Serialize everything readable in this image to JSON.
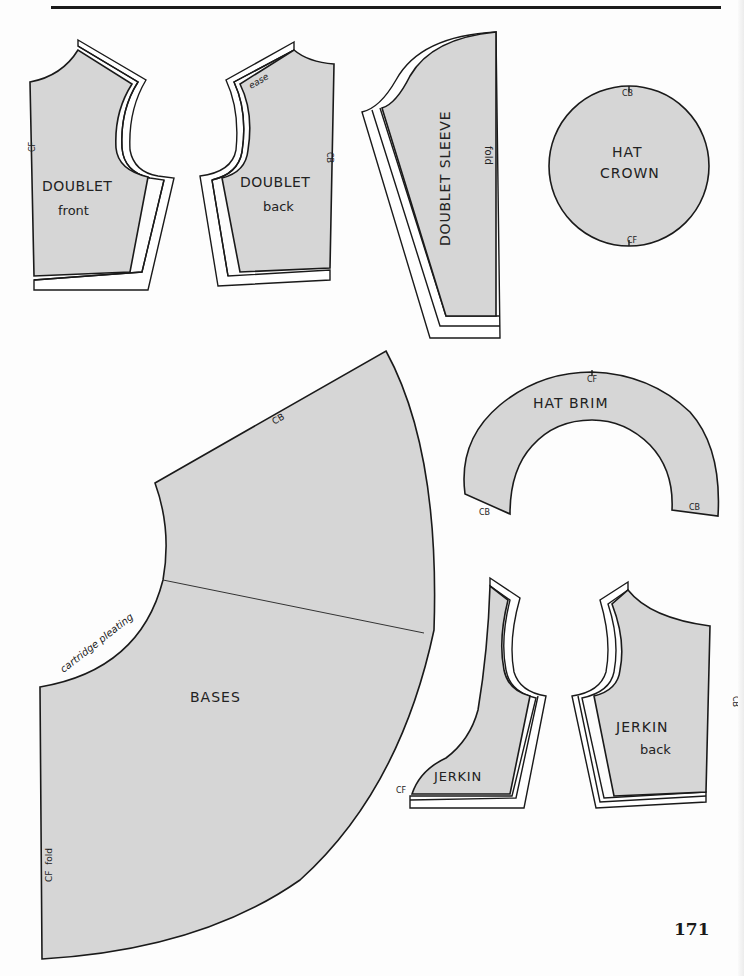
{
  "page": {
    "number": "171",
    "colors": {
      "fill": "#d6d6d6",
      "stroke": "#1a1a1a",
      "paper": "#fdfdfd"
    }
  },
  "pieces": {
    "doublet_front": {
      "title": "DOUBLET",
      "subtitle": "front",
      "mark_cf": "CF"
    },
    "doublet_back": {
      "title": "DOUBLET",
      "subtitle": "back",
      "mark_cb": "CB",
      "note_ease": "ease"
    },
    "doublet_sleeve": {
      "title": "DOUBLET SLEEVE",
      "mark_fold": "fold"
    },
    "hat_crown": {
      "title_line1": "HAT",
      "title_line2": "CROWN",
      "mark_cb": "CB",
      "mark_cf": "CF"
    },
    "hat_brim": {
      "title": "HAT BRIM",
      "mark_cf": "CF",
      "mark_cb_left": "CB",
      "mark_cb_right": "CB"
    },
    "bases": {
      "title": "BASES",
      "mark_cb": "CB",
      "note_pleating": "cartridge pleating",
      "mark_cf_fold": "CF  fold"
    },
    "jerkin_front": {
      "title": "JERKIN",
      "mark_cf": "CF"
    },
    "jerkin_back": {
      "title": "JERKIN",
      "subtitle": "back",
      "mark_cb": "CB"
    }
  }
}
